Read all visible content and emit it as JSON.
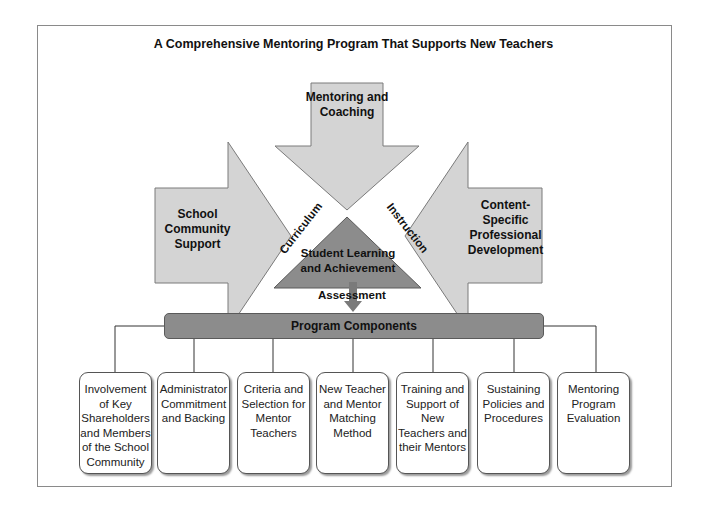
{
  "diagram": {
    "title": "A Comprehensive Mentoring Program That Supports New Teachers",
    "arrows": {
      "top": "Mentoring and Coaching",
      "left": "School Community Support",
      "right": "Content-Specific Professional Development"
    },
    "center": {
      "label": "Student Learning and Achievement",
      "sides": {
        "left": "Curriculum",
        "right": "Instruction",
        "bottom": "Assessment"
      }
    },
    "components_header": "Program Components",
    "components": [
      "Involvement of Key Shareholders and Members of the School Community",
      "Administrator Commitment and Backing",
      "Criteria and Selection for Mentor Teachers",
      "New Teacher and Mentor Matching Method",
      "Training and Support of New Teachers and their Mentors",
      "Sustaining Policies and Procedures",
      "Mentoring Program Evaluation"
    ],
    "colors": {
      "arrow_fill": "#d4d4d4",
      "triangle_fill": "#8c8c8c",
      "bar_fill": "#8c8c8c",
      "down_arrow": "#7a7a7a"
    }
  }
}
